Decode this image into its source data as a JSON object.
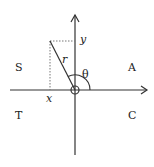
{
  "diagram": {
    "type": "cast-diagram",
    "quadrants": {
      "first": "A",
      "second": "S",
      "third": "T",
      "fourth": "C"
    },
    "labels": {
      "x": "x",
      "y": "y",
      "r": "r",
      "theta": "θ"
    },
    "colors": {
      "line": "#333333",
      "dotted": "#777777"
    }
  }
}
